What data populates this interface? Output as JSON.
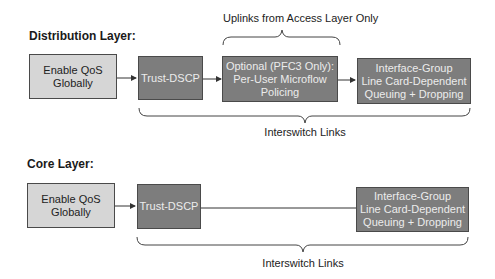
{
  "distribution": {
    "heading": "Distribution Layer:",
    "top_brace_label": "Uplinks from Access Layer Only",
    "bottom_brace_label": "Interswitch Links",
    "boxes": [
      {
        "text": "Enable QoS\nGlobally",
        "line1": "Enable QoS",
        "line2": "Globally",
        "style": "light"
      },
      {
        "text": "Trust-DSCP",
        "style": "dark"
      },
      {
        "line1": "Optional (PFC3 Only):",
        "line2": "Per-User Microflow",
        "line3": "Policing",
        "style": "dark"
      },
      {
        "line1": "Interface-Group",
        "line2": "Line Card-Dependent",
        "line3": "Queuing + Dropping",
        "style": "dark"
      }
    ]
  },
  "core": {
    "heading": "Core Layer:",
    "bottom_brace_label": "Interswitch Links",
    "boxes": [
      {
        "line1": "Enable QoS",
        "line2": "Globally",
        "style": "light"
      },
      {
        "text": "Trust-DSCP",
        "style": "dark"
      },
      {
        "line1": "Interface-Group",
        "line2": "Line Card-Dependent",
        "line3": "Queuing + Dropping",
        "style": "dark"
      }
    ]
  },
  "colors": {
    "light_box": "#d6d6d6",
    "dark_box": "#7d7d7d",
    "line": "#333333"
  }
}
